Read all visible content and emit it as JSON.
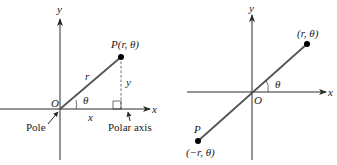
{
  "left_diagram": {
    "title": "Polar and Cartesian coordinates",
    "axis_x_label": "x",
    "axis_y_label": "y",
    "origin_label": "O",
    "point_label": "P(r, θ)",
    "radius_label": "r",
    "angle_label": "θ",
    "horizontal_leg_label": "x",
    "vertical_leg_label": "y",
    "pole_label": "Pole",
    "polar_axis_label": "Polar axis"
  },
  "right_diagram": {
    "title": "Negative radius",
    "axis_x_label": "x",
    "axis_y_label": "y",
    "origin_label": "O",
    "point_label": "(r, θ)",
    "angle_label": "θ",
    "neg_point_name": "P",
    "neg_point_label": "(−r, θ)"
  },
  "colors": {
    "axis": "#2a2a2a",
    "ray": "#555555",
    "text": "#1a1a1a",
    "point": "#000000"
  }
}
